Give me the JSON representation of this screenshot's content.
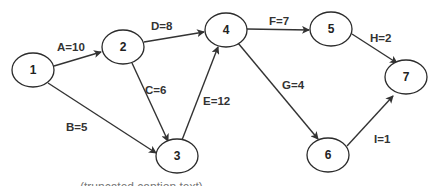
{
  "diagram": {
    "type": "activity-on-arrow network",
    "nodes": [
      {
        "id": "1",
        "label": "1",
        "cx": 33,
        "cy": 70
      },
      {
        "id": "2",
        "label": "2",
        "cx": 123,
        "cy": 47
      },
      {
        "id": "3",
        "label": "3",
        "cx": 177,
        "cy": 156
      },
      {
        "id": "4",
        "label": "4",
        "cx": 226,
        "cy": 30
      },
      {
        "id": "5",
        "label": "5",
        "cx": 331,
        "cy": 29
      },
      {
        "id": "6",
        "label": "6",
        "cx": 328,
        "cy": 155
      },
      {
        "id": "7",
        "label": "7",
        "cx": 406,
        "cy": 77
      }
    ],
    "edges": [
      {
        "from": "1",
        "to": "2",
        "activity": "A",
        "duration": 10,
        "label": "A=10"
      },
      {
        "from": "1",
        "to": "3",
        "activity": "B",
        "duration": 5,
        "label": "B=5"
      },
      {
        "from": "2",
        "to": "3",
        "activity": "C",
        "duration": 6,
        "label": "C=6"
      },
      {
        "from": "2",
        "to": "4",
        "activity": "D",
        "duration": 8,
        "label": "D=8"
      },
      {
        "from": "3",
        "to": "4",
        "activity": "E",
        "duration": 12,
        "label": "E=12"
      },
      {
        "from": "4",
        "to": "5",
        "activity": "F",
        "duration": 7,
        "label": "F=7"
      },
      {
        "from": "4",
        "to": "6",
        "activity": "G",
        "duration": 4,
        "label": "G=4"
      },
      {
        "from": "5",
        "to": "7",
        "activity": "H",
        "duration": 2,
        "label": "H=2"
      },
      {
        "from": "6",
        "to": "7",
        "activity": "I",
        "duration": 1,
        "label": "I=1"
      }
    ],
    "caption": "(truncated caption text)"
  },
  "colors": {
    "stroke": "#2b2b2b",
    "text": "#222222",
    "background": "#ffffff"
  }
}
